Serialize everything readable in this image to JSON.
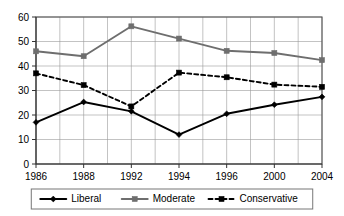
{
  "chart_data": {
    "type": "line",
    "title": "",
    "subtitle": "",
    "xlabel": "",
    "ylabel": "",
    "categories": [
      "1986",
      "1988",
      "1992",
      "1994",
      "1996",
      "2000",
      "2004"
    ],
    "ylim": [
      0,
      60
    ],
    "yticks": [
      0,
      10,
      20,
      30,
      40,
      50,
      60
    ],
    "ytick_labels": [
      "0",
      "10",
      "20",
      "30",
      "40",
      "50",
      "60"
    ],
    "grid": true,
    "grid_minor_x": true,
    "legend_position": "bottom",
    "series": [
      {
        "name": "Liberal",
        "color": "#000000",
        "line_style": "solid",
        "marker": "diamond",
        "values": [
          17,
          25.3,
          21.5,
          12,
          20.5,
          24.2,
          27.4
        ]
      },
      {
        "name": "Moderate",
        "color": "#6e6e6e",
        "line_style": "solid",
        "marker": "square",
        "values": [
          46,
          44,
          56.2,
          51.2,
          46.2,
          45.3,
          42.4
        ]
      },
      {
        "name": "Conservative",
        "color": "#000000",
        "line_style": "dashed",
        "marker": "square",
        "values": [
          37,
          32.2,
          23.5,
          37.3,
          35.4,
          32.4,
          31.5
        ]
      }
    ]
  },
  "legend": {
    "items": [
      {
        "label": "Liberal"
      },
      {
        "label": "Moderate"
      },
      {
        "label": "Conservative"
      }
    ]
  }
}
